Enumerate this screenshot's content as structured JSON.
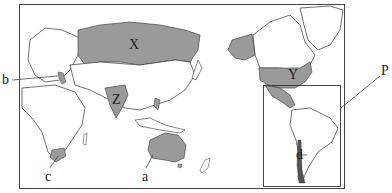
{
  "map": {
    "type": "world-map-pacific-centered",
    "shaded_color": "#9a9a9a",
    "land_color": "#ffffff",
    "line_color": "#333333",
    "region_labels": [
      {
        "id": "X",
        "text": "X",
        "region": "Russia"
      },
      {
        "id": "Y",
        "text": "Y",
        "region": "United States"
      },
      {
        "id": "Z",
        "text": "Z",
        "region": "India"
      }
    ],
    "pointer_labels": [
      {
        "id": "a",
        "text": "a",
        "target": "Australia"
      },
      {
        "id": "b",
        "text": "b",
        "target": "Italy"
      },
      {
        "id": "c",
        "text": "c",
        "target": "South Africa"
      },
      {
        "id": "d",
        "text": "d",
        "target": "Chile"
      },
      {
        "id": "P",
        "text": "P",
        "target": "Latin America box"
      }
    ]
  }
}
